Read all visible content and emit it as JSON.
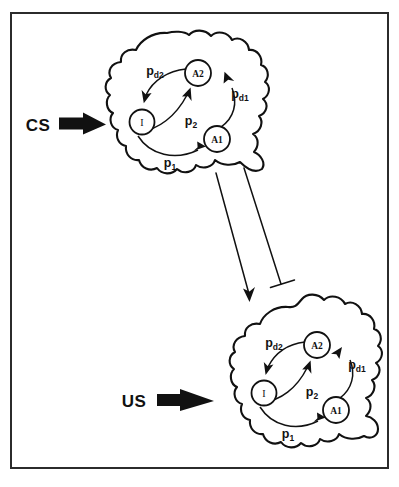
{
  "figure": {
    "title": "",
    "colors": {
      "ink": "#111111",
      "frame": "#2b2b2b",
      "background": "#ffffff"
    }
  },
  "stimuli": [
    {
      "id": "cs",
      "label": "CS",
      "target": "upper-cell"
    },
    {
      "id": "us",
      "label": "US",
      "target": "lower-cell"
    }
  ],
  "cells": [
    {
      "id": "upper-cell",
      "name": "CS cell",
      "nodes": [
        {
          "id": "a2",
          "label": "A2"
        },
        {
          "id": "i",
          "label": "I"
        },
        {
          "id": "a1",
          "label": "A1"
        }
      ],
      "transitions": [
        {
          "id": "pd2",
          "from": "a2",
          "to": "i",
          "base": "p",
          "sub": "d2"
        },
        {
          "id": "p2",
          "from": "i",
          "to": "a2",
          "base": "p",
          "sub": "2"
        },
        {
          "id": "pd1",
          "from": "a1",
          "to": "a2",
          "base": "p",
          "sub": "d1"
        },
        {
          "id": "p1",
          "from": "i",
          "to": "a1",
          "base": "p",
          "sub": "1"
        }
      ]
    },
    {
      "id": "lower-cell",
      "name": "US cell",
      "nodes": [
        {
          "id": "a2",
          "label": "A2"
        },
        {
          "id": "i",
          "label": "I"
        },
        {
          "id": "a1",
          "label": "A1"
        }
      ],
      "transitions": [
        {
          "id": "pd2",
          "from": "a2",
          "to": "i",
          "base": "p",
          "sub": "d2"
        },
        {
          "id": "p2",
          "from": "i",
          "to": "a2",
          "base": "p",
          "sub": "2"
        },
        {
          "id": "pd1",
          "from": "a1",
          "to": "a2",
          "base": "p",
          "sub": "d1"
        },
        {
          "id": "p1",
          "from": "i",
          "to": "a1",
          "base": "p",
          "sub": "1"
        }
      ]
    }
  ],
  "connector": {
    "id": "cell-to-cell-projection",
    "from": "upper-cell",
    "to": "lower-cell",
    "label": "",
    "left_terminal": "arrowhead",
    "right_terminal": "t-bar"
  }
}
